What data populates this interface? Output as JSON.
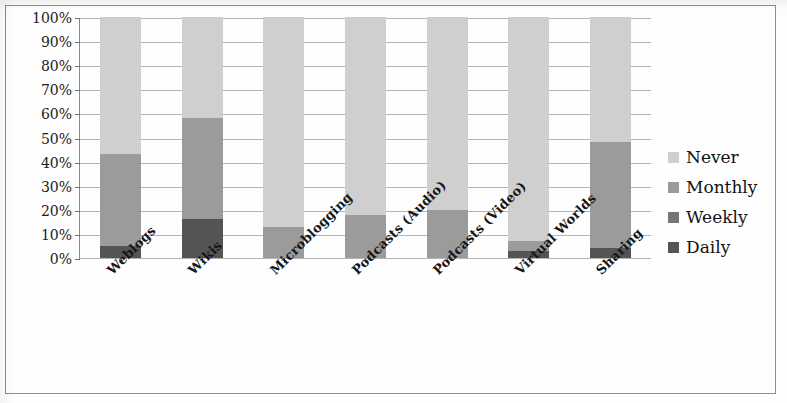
{
  "chart_data": {
    "type": "bar",
    "subtype": "stacked-bar-100",
    "title": "",
    "subtitle": "",
    "xlabel": "",
    "ylabel": "",
    "ylim": [
      0,
      100
    ],
    "ytick_labels": [
      "100%",
      "90%",
      "80%",
      "70%",
      "60%",
      "50%",
      "40%",
      "30%",
      "20%",
      "10%",
      "0%"
    ],
    "ytick_values": [
      100,
      90,
      80,
      70,
      60,
      50,
      40,
      30,
      20,
      10,
      0
    ],
    "grid": true,
    "legend_position": "right",
    "categories": [
      "Weblogs",
      "Wikis",
      "Microblogging",
      "Podcasts (Audio)",
      "Podcasts (Video)",
      "Virtual Worlds",
      "Sharing"
    ],
    "series": [
      {
        "name": "Daily",
        "color": "#545454",
        "values": [
          5,
          16,
          0,
          0,
          0,
          3,
          4
        ]
      },
      {
        "name": "Weekly",
        "color": "#767676",
        "values": [
          0,
          0,
          0,
          0,
          0,
          0,
          0
        ]
      },
      {
        "name": "Monthly",
        "color": "#9b9b9b",
        "values": [
          38,
          42,
          13,
          18,
          20,
          4,
          44
        ]
      },
      {
        "name": "Never",
        "color": "#cfcfcf",
        "values": [
          57,
          42,
          87,
          82,
          80,
          93,
          52
        ]
      }
    ],
    "legend_order_top_to_bottom": [
      "Never",
      "Monthly",
      "Weekly",
      "Daily"
    ]
  },
  "legend": {
    "items": [
      {
        "label": "Never",
        "color": "#cfcfcf"
      },
      {
        "label": "Monthly",
        "color": "#9b9b9b"
      },
      {
        "label": "Weekly",
        "color": "#767676"
      },
      {
        "label": "Daily",
        "color": "#545454"
      }
    ]
  },
  "colors": {
    "page_background": "#fefefe",
    "border": "#8d8d8d",
    "axis": "#8a8a8a",
    "gridline": "#b4b4b4",
    "text": "#161616"
  }
}
